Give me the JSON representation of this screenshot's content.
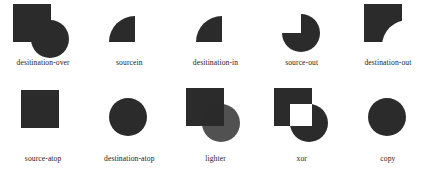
{
  "figure": {
    "shape_color": "#2b2b2b",
    "background_color": "#ffffff",
    "knockout_color": "#ffffff"
  },
  "chart_data": {
    "type": "table",
    "columns": [
      "label",
      "composition"
    ],
    "rows": [
      {
        "label": "desitination-over",
        "composition": "square and circle both fully drawn, circle offset to lower-right"
      },
      {
        "label": "sourcein",
        "composition": "quarter wedge, rounded top-left corner"
      },
      {
        "label": "desitination-in",
        "composition": "quarter wedge, rounded top-left corner"
      },
      {
        "label": "source-out",
        "composition": "circle with top-left quadrant removed"
      },
      {
        "label": "destination-out",
        "composition": "square with quarter-circle bite removed at bottom-right"
      },
      {
        "label": "source-atop",
        "composition": "solid square only"
      },
      {
        "label": "destination-atop",
        "composition": "solid circle only"
      },
      {
        "label": "lighter",
        "composition": "square and circle with lightened overlap region"
      },
      {
        "label": "xor",
        "composition": "square and circle with overlap knocked out to white"
      },
      {
        "label": "copy",
        "composition": "solid circle only"
      }
    ]
  },
  "rows": [
    {
      "cells": [
        {
          "label": "desitination-over"
        },
        {
          "label": "sourcein"
        },
        {
          "label": "desitination-in"
        },
        {
          "label": "source-out"
        },
        {
          "label": "destination-out"
        }
      ]
    },
    {
      "cells": [
        {
          "label": "source-atop"
        },
        {
          "label": "destination-atop"
        },
        {
          "label": "lighter"
        },
        {
          "label": "xor"
        },
        {
          "label": "copy"
        }
      ]
    }
  ]
}
